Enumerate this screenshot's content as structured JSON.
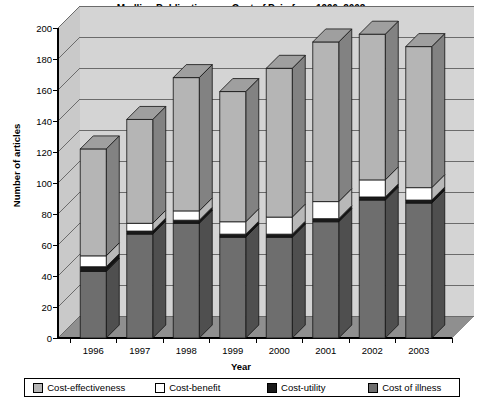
{
  "chart_data": {
    "type": "bar",
    "subtype": "stacked-column-3d",
    "title": "Medline Publications on Cost of Pain from 1996–2003",
    "xlabel": "Year",
    "ylabel": "Number of articles",
    "categories": [
      "1996",
      "1997",
      "1998",
      "1999",
      "2000",
      "2001",
      "2002",
      "2003"
    ],
    "ylim": [
      0,
      200
    ],
    "yticks": [
      0,
      20,
      40,
      60,
      80,
      100,
      120,
      140,
      160,
      180,
      200
    ],
    "grid": true,
    "legend_position": "bottom",
    "stack_order_bottom_to_top": [
      "Cost of illness",
      "Cost-utility",
      "Cost-benefit",
      "Cost-effectiveness"
    ],
    "series": [
      {
        "name": "Cost of illness",
        "color": "#6e6e6e",
        "values": [
          43,
          67,
          74,
          65,
          65,
          75,
          89,
          87
        ]
      },
      {
        "name": "Cost-utility",
        "color": "#1a1a1a",
        "values": [
          3,
          2,
          2,
          2,
          2,
          2,
          2,
          2
        ]
      },
      {
        "name": "Cost-benefit",
        "color": "#ffffff",
        "values": [
          7,
          5,
          6,
          8,
          11,
          11,
          11,
          8
        ]
      },
      {
        "name": "Cost-effectiveness",
        "color": "#b5b5b5",
        "values": [
          69,
          67,
          86,
          84,
          96,
          103,
          94,
          91
        ]
      }
    ],
    "totals": [
      122,
      141,
      168,
      159,
      174,
      191,
      196,
      188
    ]
  },
  "legend": {
    "items": [
      {
        "label": "Cost-effectiveness",
        "color": "#b5b5b5"
      },
      {
        "label": "Cost-benefit",
        "color": "#ffffff"
      },
      {
        "label": "Cost-utility",
        "color": "#1a1a1a"
      },
      {
        "label": "Cost of illness",
        "color": "#6e6e6e"
      }
    ]
  },
  "colors": {
    "back_wall": "#d4d4d4",
    "side_wall": "#c9c9c9",
    "floor": "#8f8f8f",
    "gridline": "#6b6b6b",
    "axis": "#000000"
  }
}
